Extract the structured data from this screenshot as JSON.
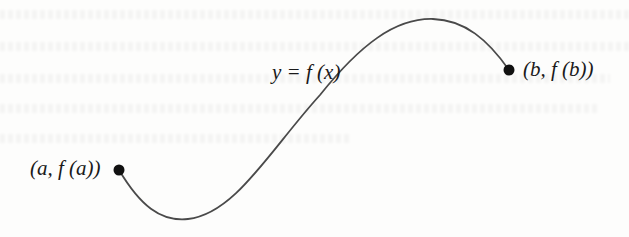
{
  "figure": {
    "curve_label": "y = f (x)",
    "left_point_label": "(a, f (a))",
    "right_point_label": "(b, f (b))",
    "curve_color": "#4a4a4a",
    "point_color": "#111111"
  }
}
